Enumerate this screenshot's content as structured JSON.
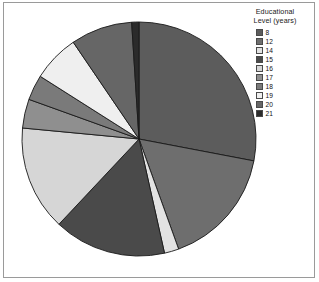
{
  "chart_data": {
    "type": "pie",
    "title": "",
    "legend_title": "Educational Level (years)",
    "legend_title_lines": [
      "Educational",
      "Level (years)"
    ],
    "legend_position": "top-right",
    "categories": [
      "8",
      "12",
      "14",
      "15",
      "16",
      "17",
      "18",
      "19",
      "20",
      "21"
    ],
    "values": [
      28.0,
      16.5,
      2.0,
      15.5,
      14.5,
      4.0,
      3.5,
      6.5,
      8.5,
      1.0
    ],
    "colors": [
      "#5c5c5c",
      "#6e6e6e",
      "#e2e2e2",
      "#4a4a4a",
      "#d6d6d6",
      "#8f8f8f",
      "#7a7a7a",
      "#efefef",
      "#666666",
      "#2b2b2b"
    ],
    "slices": [
      {
        "label": "8",
        "value": 28.0,
        "color": "#5c5c5c"
      },
      {
        "label": "12",
        "value": 16.5,
        "color": "#6e6e6e"
      },
      {
        "label": "14",
        "value": 2.0,
        "color": "#e2e2e2"
      },
      {
        "label": "15",
        "value": 15.5,
        "color": "#4a4a4a"
      },
      {
        "label": "16",
        "value": 14.5,
        "color": "#d6d6d6"
      },
      {
        "label": "17",
        "value": 4.0,
        "color": "#8f8f8f"
      },
      {
        "label": "18",
        "value": 3.5,
        "color": "#7a7a7a"
      },
      {
        "label": "19",
        "value": 6.5,
        "color": "#efefef"
      },
      {
        "label": "20",
        "value": 8.5,
        "color": "#666666"
      },
      {
        "label": "21",
        "value": 1.0,
        "color": "#2b2b2b"
      }
    ],
    "start_angle_deg": 0,
    "direction": "clockwise",
    "xlabel": "",
    "ylabel": "",
    "grid": false
  },
  "legend": {
    "title_line1": "Educational",
    "title_line2": "Level (years)",
    "items": [
      {
        "label": "8",
        "color": "#5c5c5c"
      },
      {
        "label": "12",
        "color": "#6e6e6e"
      },
      {
        "label": "14",
        "color": "#e2e2e2"
      },
      {
        "label": "15",
        "color": "#4a4a4a"
      },
      {
        "label": "16",
        "color": "#d6d6d6"
      },
      {
        "label": "17",
        "color": "#8f8f8f"
      },
      {
        "label": "18",
        "color": "#7a7a7a"
      },
      {
        "label": "19",
        "color": "#efefef"
      },
      {
        "label": "20",
        "color": "#666666"
      },
      {
        "label": "21",
        "color": "#2b2b2b"
      }
    ]
  },
  "figure": {
    "border_color": "#9a9a9a",
    "background": "#ffffff",
    "pie_center_x": 139,
    "pie_center_y": 139,
    "pie_radius": 117,
    "slice_edge_color": "#1a1a1a"
  }
}
